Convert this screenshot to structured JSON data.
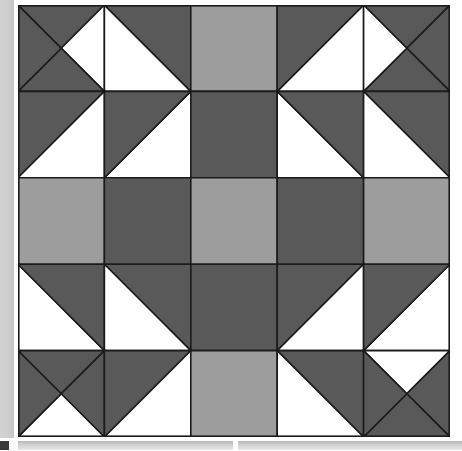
{
  "app": {
    "view_name": "quilt-block-preview",
    "canvas_label": "Quilt Block Pattern"
  },
  "palette": {
    "dark": "#595959",
    "medium": "#9d9d9d",
    "light": "#ffffff",
    "outline": "#1b1b1b",
    "chrome_scrollbar": "#cfcfcf",
    "chrome_bar": "#d8d8d8",
    "chip": "#3a3a3a"
  },
  "quilt": {
    "name": "Star and Chain Block",
    "grid_columns": 5,
    "grid_rows": 5,
    "cell_size": 86.4,
    "origin_x": 18,
    "origin_y": 5,
    "width": 432,
    "height": 432,
    "stroke_width": 1.6,
    "cells": [
      {
        "r": 0,
        "c": 0,
        "name": "corner-pinwheel-top-left",
        "type": "quarter-square-x",
        "fills": [
          "dark",
          "light",
          "dark",
          "dark"
        ]
      },
      {
        "r": 0,
        "c": 1,
        "name": "flying-geese-top-left",
        "type": "half-square-bl",
        "fills": [
          "light",
          "dark"
        ]
      },
      {
        "r": 0,
        "c": 2,
        "name": "top-center-square",
        "type": "solid",
        "fills": [
          "medium"
        ]
      },
      {
        "r": 0,
        "c": 3,
        "name": "flying-geese-top-right",
        "type": "half-square-br",
        "fills": [
          "light",
          "dark"
        ]
      },
      {
        "r": 0,
        "c": 4,
        "name": "corner-pinwheel-top-right",
        "type": "quarter-square-x",
        "fills": [
          "dark",
          "dark",
          "dark",
          "light"
        ]
      },
      {
        "r": 1,
        "c": 0,
        "name": "half-square-left-upper",
        "type": "half-square-tl",
        "fills": [
          "dark",
          "light"
        ]
      },
      {
        "r": 1,
        "c": 1,
        "name": "inner-geese-top-left",
        "type": "half-square-br",
        "fills": [
          "light",
          "dark"
        ]
      },
      {
        "r": 1,
        "c": 2,
        "name": "inner-top-square",
        "type": "solid",
        "fills": [
          "dark"
        ]
      },
      {
        "r": 1,
        "c": 3,
        "name": "inner-geese-top-right",
        "type": "half-square-bl",
        "fills": [
          "light",
          "dark"
        ]
      },
      {
        "r": 1,
        "c": 4,
        "name": "half-square-right-upper",
        "type": "half-square-tr",
        "fills": [
          "dark",
          "light"
        ]
      },
      {
        "r": 2,
        "c": 0,
        "name": "left-mid-square",
        "type": "solid",
        "fills": [
          "medium"
        ]
      },
      {
        "r": 2,
        "c": 1,
        "name": "inner-left-square",
        "type": "solid",
        "fills": [
          "dark"
        ]
      },
      {
        "r": 2,
        "c": 2,
        "name": "center-square",
        "type": "solid",
        "fills": [
          "medium"
        ]
      },
      {
        "r": 2,
        "c": 3,
        "name": "inner-right-square",
        "type": "solid",
        "fills": [
          "dark"
        ]
      },
      {
        "r": 2,
        "c": 4,
        "name": "right-mid-square",
        "type": "solid",
        "fills": [
          "medium"
        ]
      },
      {
        "r": 3,
        "c": 0,
        "name": "half-square-left-lower",
        "type": "half-square-bl",
        "fills": [
          "light",
          "dark"
        ]
      },
      {
        "r": 3,
        "c": 1,
        "name": "inner-geese-bottom-left",
        "type": "half-square-tr",
        "fills": [
          "dark",
          "light"
        ]
      },
      {
        "r": 3,
        "c": 2,
        "name": "inner-bottom-square",
        "type": "solid",
        "fills": [
          "dark"
        ]
      },
      {
        "r": 3,
        "c": 3,
        "name": "inner-geese-bottom-right",
        "type": "half-square-tl",
        "fills": [
          "dark",
          "light"
        ]
      },
      {
        "r": 3,
        "c": 4,
        "name": "half-square-right-lower",
        "type": "half-square-br",
        "fills": [
          "light",
          "dark"
        ]
      },
      {
        "r": 4,
        "c": 0,
        "name": "corner-pinwheel-bottom-left",
        "type": "quarter-square-x",
        "fills": [
          "dark",
          "dark",
          "light",
          "dark"
        ]
      },
      {
        "r": 4,
        "c": 1,
        "name": "flying-geese-bottom-left",
        "type": "half-square-tl",
        "fills": [
          "dark",
          "light"
        ]
      },
      {
        "r": 4,
        "c": 2,
        "name": "bottom-center-square",
        "type": "solid",
        "fills": [
          "medium"
        ]
      },
      {
        "r": 4,
        "c": 3,
        "name": "flying-geese-bottom-right",
        "type": "half-square-tr",
        "fills": [
          "dark",
          "light"
        ]
      },
      {
        "r": 4,
        "c": 4,
        "name": "corner-pinwheel-bottom-right",
        "type": "quarter-square-x",
        "fills": [
          "light",
          "dark",
          "dark",
          "dark"
        ]
      }
    ]
  },
  "chrome": {
    "left_scrollbar_label": "vertical scrollbar",
    "bottom_left_bar_label": "horizontal scrollbar left",
    "bottom_right_bar_label": "horizontal scrollbar right",
    "bottom_chip_label": "status chip"
  }
}
